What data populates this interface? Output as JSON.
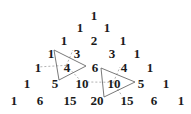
{
  "rows": [
    {
      "y": 15,
      "values": [
        "1"
      ],
      "x": [
        94
      ]
    },
    {
      "y": 27,
      "values": [
        "1",
        "1"
      ],
      "x": [
        80,
        107
      ]
    },
    {
      "y": 40,
      "values": [
        "1",
        "2",
        "1"
      ],
      "x": [
        64,
        94,
        123
      ]
    },
    {
      "y": 53,
      "values": [
        "1",
        "3",
        "3",
        "1"
      ],
      "x": [
        51,
        77,
        112,
        137
      ]
    },
    {
      "y": 67,
      "values": [
        "1",
        "4",
        "6",
        "4",
        "1"
      ],
      "x": [
        38,
        67,
        95,
        124,
        150
      ]
    },
    {
      "y": 83,
      "values": [
        "1",
        "5",
        "10",
        "10",
        "5",
        "1"
      ],
      "x": [
        27,
        55,
        82,
        114,
        141,
        166
      ]
    },
    {
      "y": 100,
      "values": [
        "1",
        "6",
        "15",
        "20",
        "15",
        "6",
        "1"
      ],
      "x": [
        14,
        40,
        70,
        97,
        127,
        154,
        181
      ]
    }
  ],
  "triangles": [
    {
      "center": "4",
      "vertices": [
        [
          54,
          50
        ],
        [
          59,
          80
        ],
        [
          86,
          66
        ]
      ],
      "dashed_to": [
        [
          37,
          67
        ],
        [
          73,
          50
        ],
        [
          80,
          80
        ]
      ]
    },
    {
      "center": "10",
      "vertices": [
        [
          101,
          68
        ],
        [
          104,
          97
        ],
        [
          135,
          82
        ]
      ],
      "dashed_to": [
        [
          120,
          67
        ],
        [
          88,
          82
        ],
        [
          122,
          96
        ]
      ]
    }
  ],
  "colors": {
    "text": "#1a1a1a",
    "line": "#6a6a6a",
    "dash": "#a0a0a0"
  }
}
